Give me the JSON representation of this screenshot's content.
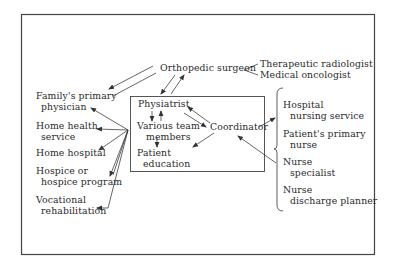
{
  "diagram": {
    "center_box": {
      "physiatrist": "Physiatrist",
      "team_line1": "Various team",
      "team_line2": "members",
      "education_line1": "Patient",
      "education_line2": "education",
      "coordinator": "Coordinator"
    },
    "top": {
      "orthopedic_surgeon": "Orthopedic surgeon",
      "therapeutic_radiologist": "Therapeutic radiologist",
      "medical_oncologist": "Medical oncologist"
    },
    "left_nodes": [
      {
        "line1": "Family's primary",
        "line2": "physician"
      },
      {
        "line1": "Home health",
        "line2": "service"
      },
      {
        "line1": "Home hospital",
        "line2": ""
      },
      {
        "line1": "Hospice or",
        "line2": "hospice program"
      },
      {
        "line1": "Vocational",
        "line2": "rehabilitation"
      }
    ],
    "right_nodes": [
      {
        "line1": "Hospital",
        "line2": "nursing service"
      },
      {
        "line1": "Patient's primary",
        "line2": "nurse"
      },
      {
        "line1": "Nurse",
        "line2": "specialist"
      },
      {
        "line1": "Nurse",
        "line2": "discharge planner"
      }
    ],
    "colors": {
      "line": "#333333",
      "frame": "#444444",
      "background": "#ffffff"
    }
  }
}
